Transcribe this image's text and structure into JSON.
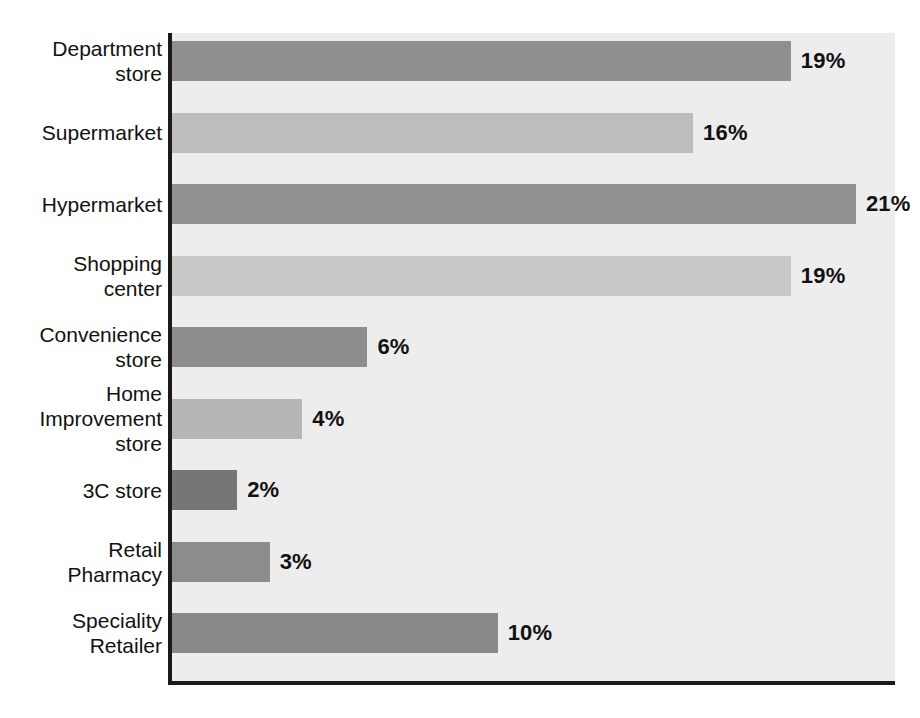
{
  "chart_data": {
    "type": "bar",
    "orientation": "horizontal",
    "title": "",
    "subtitle": "",
    "xlabel": "",
    "ylabel": "",
    "grid": false,
    "legend": false,
    "xlim": [
      0,
      22.2
    ],
    "value_suffix": "%",
    "categories": [
      "Department\nstore",
      "Supermarket",
      "Hypermarket",
      "Shopping\ncenter",
      "Convenience\nstore",
      "Home\nImprovement\nstore",
      "3C store",
      "Retail\nPharmacy",
      "Speciality\nRetailer"
    ],
    "values": [
      19,
      16,
      21,
      19,
      6,
      4,
      2,
      3,
      10
    ],
    "value_labels": [
      "19%",
      "16%",
      "21%",
      "19%",
      "6%",
      "4%",
      "2%",
      "3%",
      "10%"
    ],
    "bar_colors": [
      "#8f8f8f",
      "#bdbdbd",
      "#919191",
      "#c9c9c9",
      "#8d8d8d",
      "#b6b6b6",
      "#767676",
      "#8c8c8c",
      "#898989"
    ]
  },
  "style": {
    "plot_background": "#ededed",
    "axis_color": "#1a1a1a",
    "text_color": "#111111",
    "page_background": "#ffffff"
  }
}
